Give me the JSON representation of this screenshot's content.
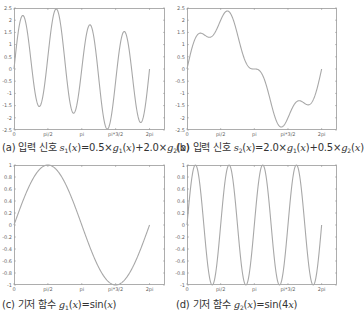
{
  "style": {
    "curve_color": "#a8a8a8",
    "axis_color": "#9a9a9a",
    "tick_label_color": "#666666",
    "caption_color": "#333333",
    "background": "#ffffff"
  },
  "chart_data": [
    {
      "id": "a",
      "type": "line",
      "title": "(a) 입력 신호 s1(x)=0.5×g1(x)+2.0×g2(x)",
      "caption": {
        "prefix": "(a) 입력 신호 ",
        "fn": "s",
        "sub": "1",
        "rest": [
          [
            "(",
            ""
          ],
          [
            "x",
            "i"
          ],
          [
            ")=0.5×",
            ""
          ],
          [
            "g",
            "i"
          ],
          [
            "1",
            "sub"
          ],
          [
            "(",
            ""
          ],
          [
            "x",
            "i"
          ],
          [
            ")+2.0×",
            ""
          ],
          [
            "g",
            "i"
          ],
          [
            "2",
            "sub"
          ],
          [
            "(",
            ""
          ],
          [
            "x",
            "i"
          ],
          [
            ")",
            ""
          ]
        ]
      },
      "formula": {
        "a1": 0.5,
        "k1": 1,
        "a2": 2.0,
        "k2": 4
      },
      "xlim": [
        0,
        7
      ],
      "ylim": [
        -2.5,
        2.5
      ],
      "x_range": [
        0,
        6.2832
      ],
      "xticks": [
        {
          "v": 0,
          "label": "0"
        },
        {
          "v": 1.5708,
          "label": "pi/2"
        },
        {
          "v": 3.1416,
          "label": "pi"
        },
        {
          "v": 4.7124,
          "label": "pi*3/2"
        },
        {
          "v": 6.2832,
          "label": "2pi"
        }
      ],
      "yticks": [
        {
          "v": 2.5,
          "label": "2.5"
        },
        {
          "v": 2,
          "label": "2"
        },
        {
          "v": 1.5,
          "label": "1.5"
        },
        {
          "v": 1,
          "label": "1"
        },
        {
          "v": 0.5,
          "label": "0.5"
        },
        {
          "v": 0,
          "label": "0"
        },
        {
          "v": -0.5,
          "label": "-0.5"
        },
        {
          "v": -1,
          "label": "-1"
        },
        {
          "v": -1.5,
          "label": "-1.5"
        },
        {
          "v": -2,
          "label": "-2"
        },
        {
          "v": -2.5,
          "label": "-2.5"
        }
      ],
      "box": {
        "left": 14,
        "top": 8,
        "width": 151,
        "height": 122
      },
      "caption_pos": {
        "left": 2,
        "top": 139
      }
    },
    {
      "id": "b",
      "type": "line",
      "title": "(b) 입력 신호 s2(x)=2.0×g1(x)+0.5×g2(x)",
      "caption": {
        "prefix": "(b) 입력 신호 ",
        "fn": "s",
        "sub": "2",
        "rest": [
          [
            "(",
            ""
          ],
          [
            "x",
            "i"
          ],
          [
            ")=2.0×",
            ""
          ],
          [
            "g",
            "i"
          ],
          [
            "1",
            "sub"
          ],
          [
            "(",
            ""
          ],
          [
            "x",
            "i"
          ],
          [
            ")+0.5×",
            ""
          ],
          [
            "g",
            "i"
          ],
          [
            "2",
            "sub"
          ],
          [
            "(",
            ""
          ],
          [
            "x",
            "i"
          ],
          [
            ")",
            ""
          ]
        ]
      },
      "formula": {
        "a1": 2.0,
        "k1": 1,
        "a2": 0.5,
        "k2": 4
      },
      "xlim": [
        0,
        7
      ],
      "ylim": [
        -2.5,
        2.5
      ],
      "x_range": [
        0,
        6.2832
      ],
      "xticks": [
        {
          "v": 0,
          "label": "0"
        },
        {
          "v": 1.5708,
          "label": "pi/2"
        },
        {
          "v": 3.1416,
          "label": "pi"
        },
        {
          "v": 4.7124,
          "label": "pi*3/2"
        },
        {
          "v": 6.2832,
          "label": "2pi"
        }
      ],
      "yticks": [
        {
          "v": 2.5,
          "label": "2.5"
        },
        {
          "v": 2,
          "label": "2"
        },
        {
          "v": 1.5,
          "label": "1.5"
        },
        {
          "v": 1,
          "label": "1"
        },
        {
          "v": 0.5,
          "label": "0.5"
        },
        {
          "v": 0,
          "label": "0"
        },
        {
          "v": -0.5,
          "label": "-0.5"
        },
        {
          "v": -1,
          "label": "-1"
        },
        {
          "v": -1.5,
          "label": "-1.5"
        },
        {
          "v": -2,
          "label": "-2"
        },
        {
          "v": -2.5,
          "label": "-2.5"
        }
      ],
      "box": {
        "left": 187,
        "top": 8,
        "width": 150,
        "height": 122
      },
      "caption_pos": {
        "left": 176,
        "top": 139
      }
    },
    {
      "id": "c",
      "type": "line",
      "title": "(c) 기저 함수 g1(x)=sin(x)",
      "caption": {
        "prefix": "(c) 기저 함수 ",
        "fn": "g",
        "sub": "1",
        "rest": [
          [
            "(",
            ""
          ],
          [
            "x",
            "i"
          ],
          [
            ")=sin(",
            ""
          ],
          [
            "x",
            "i"
          ],
          [
            ")",
            ""
          ]
        ]
      },
      "formula": {
        "a1": 1.0,
        "k1": 1,
        "a2": 0,
        "k2": 4
      },
      "xlim": [
        0,
        7
      ],
      "ylim": [
        -1,
        1
      ],
      "x_range": [
        0,
        6.2832
      ],
      "xticks": [
        {
          "v": 0,
          "label": "0"
        },
        {
          "v": 1.5708,
          "label": "pi/2"
        },
        {
          "v": 3.1416,
          "label": "pi"
        },
        {
          "v": 4.7124,
          "label": "pi*3/2"
        },
        {
          "v": 6.2832,
          "label": "2pi"
        }
      ],
      "yticks": [
        {
          "v": 1,
          "label": "1"
        },
        {
          "v": 0.8,
          "label": "0.8"
        },
        {
          "v": 0.6,
          "label": "0.6"
        },
        {
          "v": 0.4,
          "label": "0.4"
        },
        {
          "v": 0.2,
          "label": "0.2"
        },
        {
          "v": 0,
          "label": "0"
        },
        {
          "v": -0.2,
          "label": "-0.2"
        },
        {
          "v": -0.4,
          "label": "-0.4"
        },
        {
          "v": -0.6,
          "label": "-0.6"
        },
        {
          "v": -0.8,
          "label": "-0.8"
        },
        {
          "v": -1,
          "label": "-1"
        }
      ],
      "box": {
        "left": 14,
        "top": 165,
        "width": 151,
        "height": 120
      },
      "caption_pos": {
        "left": 2,
        "top": 296
      }
    },
    {
      "id": "d",
      "type": "line",
      "title": "(d) 기저 함수 g2(x)=sin(4x)",
      "caption": {
        "prefix": "(d) 기저 함수 ",
        "fn": "g",
        "sub": "2",
        "rest": [
          [
            "(",
            ""
          ],
          [
            "x",
            "i"
          ],
          [
            ")=sin(4",
            ""
          ],
          [
            "x",
            "i"
          ],
          [
            ")",
            ""
          ]
        ]
      },
      "formula": {
        "a1": 0,
        "k1": 1,
        "a2": 1.0,
        "k2": 4
      },
      "xlim": [
        0,
        7
      ],
      "ylim": [
        -1,
        1
      ],
      "x_range": [
        0,
        6.2832
      ],
      "xticks": [
        {
          "v": 0,
          "label": "0"
        },
        {
          "v": 1.5708,
          "label": "pi/2"
        },
        {
          "v": 3.1416,
          "label": "pi"
        },
        {
          "v": 4.7124,
          "label": "pi*3/2"
        },
        {
          "v": 6.2832,
          "label": "2pi"
        }
      ],
      "yticks": [
        {
          "v": 1,
          "label": "1"
        },
        {
          "v": 0.8,
          "label": "0.8"
        },
        {
          "v": 0.6,
          "label": "0.6"
        },
        {
          "v": 0.4,
          "label": "0.4"
        },
        {
          "v": 0.2,
          "label": "0.2"
        },
        {
          "v": 0,
          "label": "0"
        },
        {
          "v": -0.2,
          "label": "-0.2"
        },
        {
          "v": -0.4,
          "label": "-0.4"
        },
        {
          "v": -0.6,
          "label": "-0.6"
        },
        {
          "v": -0.8,
          "label": "-0.8"
        },
        {
          "v": -1,
          "label": "-1"
        }
      ],
      "box": {
        "left": 187,
        "top": 165,
        "width": 150,
        "height": 120
      },
      "caption_pos": {
        "left": 176,
        "top": 296
      }
    }
  ]
}
